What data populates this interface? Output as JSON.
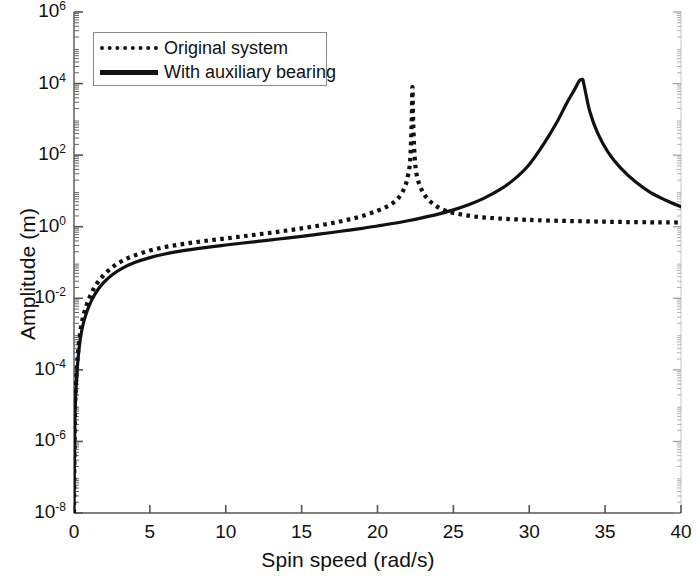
{
  "chart_data": {
    "type": "line",
    "title": "",
    "xlabel": "Spin speed (rad/s)",
    "ylabel": "Amplitude (m)",
    "xlim": [
      0,
      40
    ],
    "ylim": [
      1e-08,
      1000000.0
    ],
    "yscale": "log",
    "xscale": "linear",
    "grid": false,
    "legend_position": "upper left",
    "xticks": [
      "0",
      "5",
      "10",
      "15",
      "20",
      "25",
      "30",
      "35",
      "40"
    ],
    "xtick_values": [
      0,
      5,
      10,
      15,
      20,
      25,
      30,
      35,
      40
    ],
    "ytick_exponents": [
      6,
      4,
      2,
      0,
      -2,
      -4,
      -6,
      -8
    ],
    "yticks": [
      "10^6",
      "10^4",
      "10^2",
      "10^0",
      "10^-2",
      "10^-4",
      "10^-6",
      "10^-8"
    ],
    "series": [
      {
        "name": "Original system",
        "style": "dotted",
        "color": "#111111",
        "resonance_x": 22.3,
        "resonance_peak_y": 8000,
        "x": [
          0.0,
          0.05,
          0.1,
          0.2,
          0.35,
          0.5,
          0.7,
          1.0,
          1.4,
          1.9,
          2.5,
          3.2,
          4.0,
          5.0,
          6.0,
          7.0,
          8.0,
          9.0,
          10.0,
          11.0,
          12.0,
          13.0,
          14.0,
          15.0,
          16.0,
          17.0,
          18.0,
          19.0,
          20.0,
          20.8,
          21.4,
          21.8,
          22.0,
          22.15,
          22.25,
          22.3,
          22.35,
          22.45,
          22.6,
          22.9,
          23.3,
          23.9,
          24.6,
          25.5,
          26.5,
          27.5,
          28.5,
          29.5,
          30.5,
          32.0,
          33.5,
          35.0,
          36.5,
          38.0,
          39.0,
          40.0
        ],
        "y": [
          1e-08,
          3e-06,
          2.2e-05,
          0.00014,
          0.0007,
          0.0019,
          0.0043,
          0.01,
          0.022,
          0.042,
          0.072,
          0.112,
          0.158,
          0.215,
          0.27,
          0.32,
          0.37,
          0.42,
          0.47,
          0.53,
          0.6,
          0.68,
          0.78,
          0.9,
          1.05,
          1.26,
          1.55,
          2.0,
          2.8,
          4.0,
          6.5,
          13.0,
          26.0,
          70.0,
          800.0,
          8000.0,
          900.0,
          90.0,
          26.0,
          11.0,
          6.0,
          3.7,
          2.7,
          2.2,
          1.9,
          1.75,
          1.65,
          1.58,
          1.52,
          1.46,
          1.42,
          1.38,
          1.35,
          1.33,
          1.32,
          1.31
        ]
      },
      {
        "name": "With auxiliary bearing",
        "style": "solid",
        "color": "#111111",
        "resonance_x": 33.5,
        "resonance_peak_y": 13000,
        "x": [
          0.0,
          0.05,
          0.1,
          0.2,
          0.35,
          0.5,
          0.7,
          1.0,
          1.4,
          1.9,
          2.5,
          3.2,
          4.0,
          5.0,
          6.0,
          7.0,
          8.0,
          9.0,
          10.0,
          11.0,
          12.0,
          13.0,
          14.0,
          15.0,
          16.0,
          17.0,
          18.0,
          19.0,
          20.0,
          21.0,
          22.0,
          23.0,
          24.0,
          25.0,
          26.0,
          27.0,
          28.0,
          29.0,
          30.0,
          31.0,
          31.8,
          32.5,
          33.0,
          33.3,
          33.45,
          33.5,
          33.55,
          33.7,
          34.0,
          34.5,
          35.2,
          36.0,
          37.0,
          38.0,
          39.0,
          40.0
        ],
        "y": [
          1e-08,
          2e-06,
          1.4e-05,
          9e-05,
          0.00045,
          0.0012,
          0.0027,
          0.0062,
          0.0135,
          0.026,
          0.045,
          0.07,
          0.1,
          0.137,
          0.173,
          0.207,
          0.24,
          0.273,
          0.308,
          0.345,
          0.385,
          0.43,
          0.48,
          0.54,
          0.61,
          0.69,
          0.79,
          0.9,
          1.05,
          1.23,
          1.47,
          1.8,
          2.25,
          2.95,
          4.1,
          6.2,
          10.5,
          21.0,
          55.0,
          220.0,
          800.0,
          3000.0,
          7000.0,
          12000.0,
          13000.0,
          13000.0,
          12000.0,
          6000.0,
          1600.0,
          420.0,
          120.0,
          45.0,
          18.0,
          9.0,
          5.5,
          3.6
        ]
      }
    ],
    "crossing_x_approx": 29.0
  },
  "legend": {
    "entries": [
      {
        "label": "Original system",
        "sample": "dotted-line-sample"
      },
      {
        "label": "With auxiliary bearing",
        "sample": "solid-line-sample"
      }
    ]
  },
  "axes": {
    "xlabel": "Spin speed (rad/s)",
    "ylabel": "Amplitude (m)",
    "xticks": [
      {
        "label": "0"
      },
      {
        "label": "5"
      },
      {
        "label": "10"
      },
      {
        "label": "15"
      },
      {
        "label": "20"
      },
      {
        "label": "25"
      },
      {
        "label": "30"
      },
      {
        "label": "35"
      },
      {
        "label": "40"
      }
    ],
    "yticks": [
      {
        "base": "10",
        "exp": "6"
      },
      {
        "base": "10",
        "exp": "4"
      },
      {
        "base": "10",
        "exp": "2"
      },
      {
        "base": "10",
        "exp": "0"
      },
      {
        "base": "10",
        "exp": "-2"
      },
      {
        "base": "10",
        "exp": "-4"
      },
      {
        "base": "10",
        "exp": "-6"
      },
      {
        "base": "10",
        "exp": "-8"
      }
    ]
  },
  "colors": {
    "axis": "#4a4a4a",
    "curve": "#111111",
    "legend_border": "#8a8a8a",
    "background": "#ffffff"
  }
}
